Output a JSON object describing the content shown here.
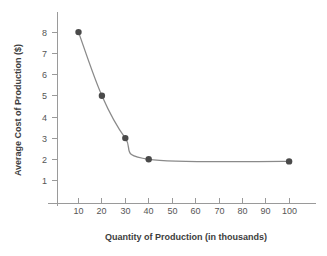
{
  "chart_data": {
    "type": "line",
    "title": "",
    "xlabel": "Quantity of Production (in thousands)",
    "ylabel": "Average Cost of Production ($)",
    "x": [
      10,
      20,
      30,
      40,
      100
    ],
    "values": [
      8,
      5,
      3,
      2,
      1.9
    ],
    "series": [
      {
        "name": "Average Cost of Production",
        "x": [
          10,
          20,
          30,
          40,
          100
        ],
        "values": [
          8,
          5,
          3,
          2,
          1.9
        ]
      }
    ],
    "xticks": [
      10,
      20,
      30,
      40,
      50,
      60,
      70,
      80,
      90,
      100
    ],
    "yticks": [
      1,
      2,
      3,
      4,
      5,
      6,
      7,
      8
    ],
    "xlim": [
      0,
      110
    ],
    "ylim": [
      0,
      8.8
    ],
    "grid": false,
    "legend": false,
    "legend_position": "none",
    "marker": "circle",
    "line_color": "#8a8a8a",
    "marker_color": "#4a4a4a",
    "axis_color": "#9a9a9a",
    "text_color": "#3d3d3d",
    "background": "#ffffff"
  },
  "axes": {
    "y_title": "Average Cost of Production ($)",
    "x_title": "Quantity of Production (in thousands)",
    "y_tick_labels": [
      "8",
      "7",
      "6",
      "5",
      "4",
      "3",
      "2",
      "1"
    ],
    "x_tick_labels": [
      "10",
      "20",
      "30",
      "40",
      "50",
      "60",
      "70",
      "80",
      "90",
      "100"
    ]
  }
}
